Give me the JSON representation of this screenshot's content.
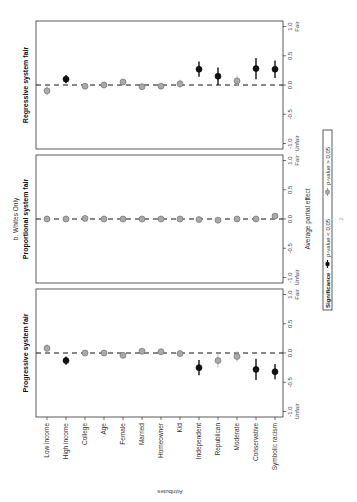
{
  "figure": {
    "subtitle": "b. Whites Only",
    "x_axis_label": "Average partial effect",
    "y_axis_label": "Attributes",
    "fair_label": "Fair",
    "unfair_label": "Unfair",
    "legend": {
      "title": "Significance",
      "sig_label": "p-value < 0.05",
      "nonsig_label": "p-value > 0.05",
      "sig_color": "#111111",
      "nonsig_color": "#aaaaaa"
    },
    "page_number": "2"
  },
  "chart_data": [
    {
      "type": "scatter",
      "title": "Progressive system fair",
      "xlabel": "Average partial effect",
      "ylabel": "Attributes",
      "xlim": [
        -1.0,
        1.0
      ],
      "ticks": [
        "-1.0",
        "-0.5",
        "0.0",
        "0.5",
        "1.0"
      ],
      "categories": [
        "Low income",
        "High income",
        "College",
        "Age",
        "Female",
        "Married",
        "Homeowner",
        "Kid",
        "Independent",
        "Republican",
        "Moderate",
        "Conservative",
        "Symbolic racism"
      ],
      "values": [
        0.08,
        -0.13,
        0.0,
        0.0,
        -0.04,
        0.03,
        0.02,
        -0.01,
        -0.25,
        -0.13,
        -0.06,
        -0.28,
        -0.32
      ],
      "ci_half_width": [
        0.07,
        0.07,
        0.05,
        0.03,
        0.05,
        0.05,
        0.05,
        0.06,
        0.13,
        0.12,
        0.09,
        0.18,
        0.13
      ],
      "significant": [
        false,
        true,
        false,
        false,
        false,
        false,
        false,
        false,
        true,
        false,
        false,
        true,
        true
      ]
    },
    {
      "type": "scatter",
      "title": "Proportional system fair",
      "xlabel": "Average partial effect",
      "ylabel": "Attributes",
      "xlim": [
        -1.0,
        1.0
      ],
      "ticks": [
        "-1.0",
        "-0.5",
        "0.0",
        "0.5",
        "1.0"
      ],
      "categories": [
        "Low income",
        "High income",
        "College",
        "Age",
        "Female",
        "Married",
        "Homeowner",
        "Kid",
        "Independent",
        "Republican",
        "Moderate",
        "Conservative",
        "Symbolic racism"
      ],
      "values": [
        0.0,
        0.0,
        0.01,
        0.0,
        0.0,
        0.0,
        0.0,
        0.0,
        -0.01,
        -0.02,
        0.0,
        0.0,
        0.05
      ],
      "ci_half_width": [
        0.03,
        0.03,
        0.03,
        0.03,
        0.03,
        0.03,
        0.03,
        0.03,
        0.03,
        0.05,
        0.03,
        0.05,
        0.04
      ],
      "significant": [
        false,
        false,
        false,
        false,
        false,
        false,
        false,
        false,
        false,
        false,
        false,
        false,
        false
      ]
    },
    {
      "type": "scatter",
      "title": "Regressive system fair",
      "xlabel": "Average partial effect",
      "ylabel": "Attributes",
      "xlim": [
        -1.0,
        1.0
      ],
      "ticks": [
        "-1.0",
        "-0.5",
        "0.0",
        "0.5",
        "1.0"
      ],
      "categories": [
        "Low income",
        "High income",
        "College",
        "Age",
        "Female",
        "Married",
        "Homeowner",
        "Kid",
        "Independent",
        "Republican",
        "Moderate",
        "Conservative",
        "Symbolic racism"
      ],
      "values": [
        -0.1,
        0.1,
        -0.02,
        0.0,
        0.05,
        -0.03,
        -0.02,
        0.02,
        0.27,
        0.15,
        0.07,
        0.28,
        0.27
      ],
      "ci_half_width": [
        0.08,
        0.07,
        0.05,
        0.03,
        0.05,
        0.05,
        0.05,
        0.07,
        0.13,
        0.15,
        0.09,
        0.18,
        0.15
      ],
      "significant": [
        false,
        true,
        false,
        false,
        false,
        false,
        false,
        false,
        true,
        true,
        false,
        true,
        true
      ]
    }
  ]
}
